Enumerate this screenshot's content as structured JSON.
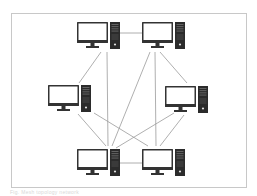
{
  "diagram": {
    "type": "mesh-network-topology",
    "frame": {
      "x": 11,
      "y": 13,
      "w": 236,
      "h": 175,
      "border_color": "#c8c8c8"
    },
    "colors": {
      "line": "#9a9a9a",
      "monitor_frame": "#333333",
      "screen": "#ffffff",
      "tower": "#2b2b2b",
      "tower_detail": "#6a6a6a"
    },
    "nodes": [
      {
        "id": "pc-top-left",
        "x": 77,
        "y": 22
      },
      {
        "id": "pc-top-right",
        "x": 142,
        "y": 22
      },
      {
        "id": "pc-mid-left",
        "x": 48,
        "y": 85
      },
      {
        "id": "pc-mid-right",
        "x": 165,
        "y": 86
      },
      {
        "id": "pc-bottom-left",
        "x": 77,
        "y": 149
      },
      {
        "id": "pc-bottom-right",
        "x": 142,
        "y": 149
      }
    ],
    "links": [
      {
        "from": "pc-top-left",
        "to": "pc-top-right",
        "x1": 120,
        "y1": 33,
        "x2": 142,
        "y2": 33
      },
      {
        "from": "pc-top-left",
        "to": "pc-mid-left",
        "x1": 101,
        "y1": 52,
        "x2": 79,
        "y2": 83
      },
      {
        "from": "pc-top-left",
        "to": "pc-bottom-left",
        "x1": 107,
        "y1": 52,
        "x2": 108,
        "y2": 146
      },
      {
        "from": "pc-top-right",
        "to": "pc-bottom-left",
        "x1": 150,
        "y1": 52,
        "x2": 112,
        "y2": 146
      },
      {
        "from": "pc-top-right",
        "to": "pc-bottom-right",
        "x1": 155,
        "y1": 52,
        "x2": 156,
        "y2": 146
      },
      {
        "from": "pc-top-right",
        "to": "pc-mid-right",
        "x1": 160,
        "y1": 52,
        "x2": 187,
        "y2": 83
      },
      {
        "from": "pc-mid-left",
        "to": "pc-bottom-left",
        "x1": 78,
        "y1": 114,
        "x2": 106,
        "y2": 146
      },
      {
        "from": "pc-mid-left",
        "to": "pc-bottom-right",
        "x1": 94,
        "y1": 113,
        "x2": 148,
        "y2": 146
      },
      {
        "from": "pc-mid-right",
        "to": "pc-bottom-left",
        "x1": 174,
        "y1": 113,
        "x2": 116,
        "y2": 148
      },
      {
        "from": "pc-mid-right",
        "to": "pc-bottom-right",
        "x1": 184,
        "y1": 115,
        "x2": 160,
        "y2": 146
      },
      {
        "from": "pc-bottom-left",
        "to": "pc-bottom-right",
        "x1": 120,
        "y1": 163,
        "x2": 142,
        "y2": 163
      }
    ]
  },
  "caption": "Fig. Mesh topology network"
}
